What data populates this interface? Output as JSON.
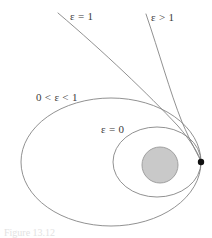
{
  "figure": {
    "caption": "Figure 13.12",
    "background_color": "#ffffff",
    "curve_color": "#7d7d7d",
    "label_color": "#3a3a3a",
    "body_fill_color": "#c9c9c9",
    "body_stroke_color": "#9a9a9a",
    "focus_color": "#111111"
  },
  "labels": {
    "parabola": "ε = 1",
    "hyperbola": "ε > 1",
    "ellipse": "0 < ε < 1",
    "circle": "ε = 0"
  },
  "chart_data": {
    "type": "line",
    "title": "",
    "subtitle": "",
    "xlabel": "",
    "ylabel": "",
    "grid": false,
    "legend_position": "inline-annotations",
    "xlim": [
      0,
      212
    ],
    "ylim": [
      238,
      0
    ],
    "annotations": [
      {
        "text": "ε = 1",
        "x": 70,
        "y": 11,
        "target": "parabola"
      },
      {
        "text": "ε > 1",
        "x": 151,
        "y": 12,
        "target": "hyperbola"
      },
      {
        "text": "0 < ε < 1",
        "x": 36,
        "y": 92,
        "target": "ellipse"
      },
      {
        "text": "ε = 0",
        "x": 101,
        "y": 124,
        "target": "circle"
      }
    ],
    "focus": {
      "x": 201,
      "y": 162,
      "r": 3.2,
      "label": "focus"
    },
    "central_body": {
      "cx": 160,
      "cy": 165,
      "r": 18,
      "fill": "#c9c9c9",
      "stroke": "#9a9a9a"
    },
    "series": [
      {
        "name": "ε = 0",
        "eccentricity": 0,
        "shape": "circle",
        "path": "M 201 162 A 44 35 0 1 0 201 161.6 Z",
        "cx": 157,
        "cy": 162,
        "rx": 44,
        "ry": 35
      },
      {
        "name": "0 < ε < 1",
        "eccentricity": 0.7,
        "shape": "ellipse",
        "path": "M 201 162 A 90 64 0 1 0 201 161.6 Z",
        "cx": 111,
        "cy": 162,
        "rx": 90,
        "ry": 64
      },
      {
        "name": "ε = 1",
        "eccentricity": 1,
        "shape": "parabola",
        "path": "M 58 13 C 104 52 150 96 181 130 C 193 143 199 155 201 162"
      },
      {
        "name": "ε > 1",
        "eccentricity": 1.6,
        "shape": "hyperbola",
        "path": "M 146 14 C 160 54 172 96 184 126 C 192 145 198 156 201 162"
      }
    ]
  }
}
